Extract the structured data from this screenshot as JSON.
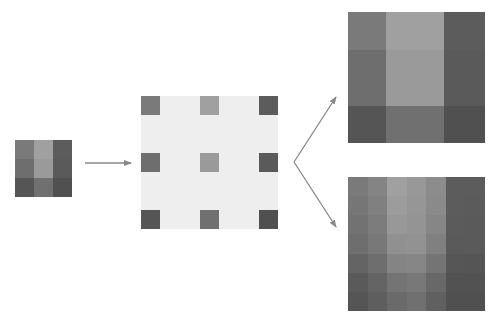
{
  "diagram": {
    "colors": {
      "background": "#ffffff",
      "sparse_fill": "#eeeeee",
      "arrow": "#888888"
    },
    "source_grid": {
      "rows": 3,
      "cols": 3,
      "cells": [
        [
          "#7a7a7a",
          "#a0a0a0",
          "#5c5c5c"
        ],
        [
          "#6e6e6e",
          "#9a9a9a",
          "#5a5a5a"
        ],
        [
          "#555555",
          "#707070",
          "#505050"
        ]
      ]
    },
    "sparse_grid": {
      "rows": 3,
      "cols": 3,
      "positions_x": [
        0,
        59,
        118
      ],
      "positions_y": [
        0,
        57,
        114
      ],
      "cells": [
        [
          "#7a7a7a",
          "#a0a0a0",
          "#5c5c5c"
        ],
        [
          "#6e6e6e",
          "#9a9a9a",
          "#5a5a5a"
        ],
        [
          "#555555",
          "#707070",
          "#505050"
        ]
      ]
    },
    "nearest_neighbor_grid": {
      "rows": 3,
      "cols": 3,
      "cells": [
        [
          "#7a7a7a",
          "#a0a0a0",
          "#5c5c5c"
        ],
        [
          "#6e6e6e",
          "#9a9a9a",
          "#5a5a5a"
        ],
        [
          "#555555",
          "#707070",
          "#505050"
        ]
      ]
    },
    "bilinear_grid": {
      "rows": 7,
      "cols": 7,
      "cells": [
        [
          "#7a7a7a",
          "#848484",
          "#a0a0a0",
          "#989898",
          "#8c8c8c",
          "#5c5c5c",
          "#5c5c5c"
        ],
        [
          "#767676",
          "#808080",
          "#9c9c9c",
          "#969696",
          "#8a8a8a",
          "#5c5c5c",
          "#5b5b5b"
        ],
        [
          "#727272",
          "#7c7c7c",
          "#989898",
          "#949494",
          "#868686",
          "#5b5b5b",
          "#5a5a5a"
        ],
        [
          "#6e6e6e",
          "#787878",
          "#909090",
          "#929292",
          "#808080",
          "#5a5a5a",
          "#5a5a5a"
        ],
        [
          "#646464",
          "#6e6e6e",
          "#848484",
          "#868686",
          "#747474",
          "#565656",
          "#555555"
        ],
        [
          "#5a5a5a",
          "#646464",
          "#747474",
          "#787878",
          "#686868",
          "#525252",
          "#525252"
        ],
        [
          "#555555",
          "#5e5e5e",
          "#6a6a6a",
          "#707070",
          "#606060",
          "#505050",
          "#505050"
        ]
      ]
    },
    "arrows": [
      {
        "from": [
          85,
          163
        ],
        "to": [
          131,
          163
        ]
      },
      {
        "from": [
          294,
          162
        ],
        "to": [
          336,
          97
        ]
      },
      {
        "from": [
          294,
          162
        ],
        "to": [
          336,
          227
        ]
      }
    ]
  }
}
